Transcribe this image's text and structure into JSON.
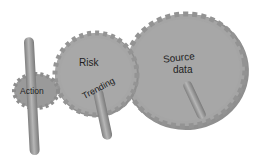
{
  "diagram": {
    "type": "gear-mechanism",
    "gears": [
      {
        "id": "action",
        "label": "Action"
      },
      {
        "id": "risk",
        "label": "Risk",
        "secondary_label": "Trending"
      },
      {
        "id": "source",
        "label_line1": "Source",
        "label_line2": "data"
      }
    ],
    "colors": {
      "gear_face": "#a3a3a3",
      "gear_edge": "#8a8a8a",
      "rod": "#8e8e8e",
      "rod_highlight": "#b4b4b4",
      "background": "#ffffff"
    }
  }
}
